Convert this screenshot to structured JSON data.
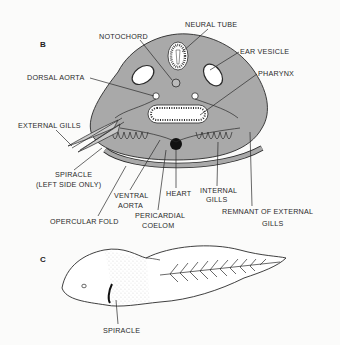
{
  "figure": {
    "panel_b": {
      "letter": "B",
      "description": "Cross-section of tadpole head region",
      "labels": {
        "notochord": "NOTOCHORD",
        "neural_tube": "NEURAL TUBE",
        "ear_vesicle": "EAR VESICLE",
        "dorsal_aorta": "DORSAL AORTA",
        "pharynx": "PHARYNX",
        "external_gills": "EXTERNAL GILLS",
        "spiracle_line1": "SPIRACLE",
        "spiracle_line2": "(LEFT SIDE ONLY)",
        "ventral_aorta_line1": "VENTRAL",
        "ventral_aorta_line2": "AORTA",
        "heart": "HEART",
        "internal_gills_line1": "INTERNAL",
        "internal_gills_line2": "GILLS",
        "opercular_fold": "OPERCULAR FOLD",
        "pericardial_coelom_line1": "PERICARDIAL",
        "pericardial_coelom_line2": "COELOM",
        "remnant_line1": "REMNANT OF EXTERNAL",
        "remnant_line2": "GILLS"
      }
    },
    "panel_c": {
      "letter": "C",
      "description": "Lateral view of tadpole",
      "labels": {
        "spiracle": "SPIRACLE"
      }
    },
    "colors": {
      "tissue_gray": "#a9a9a9",
      "line": "#2a2a2a",
      "background": "#fbfbfa",
      "cavity_white": "#ffffff"
    }
  }
}
